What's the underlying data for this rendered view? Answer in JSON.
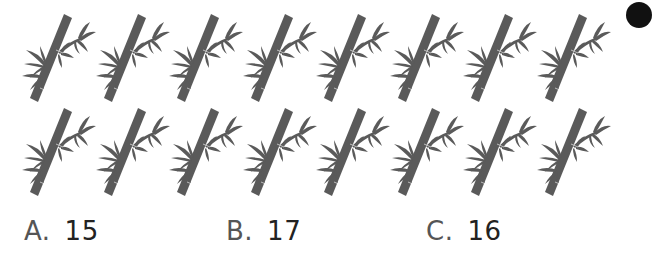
{
  "question": {
    "rows": [
      {
        "count": 8,
        "icon": "bamboo-icon"
      },
      {
        "count": 8,
        "icon": "bamboo-icon"
      }
    ],
    "colors": {
      "bamboo": "#5a5a5a",
      "text": "#333333",
      "dot": "#111111"
    }
  },
  "options": [
    {
      "letter": "A.",
      "value": "15"
    },
    {
      "letter": "B.",
      "value": "17"
    },
    {
      "letter": "C.",
      "value": "16"
    }
  ]
}
